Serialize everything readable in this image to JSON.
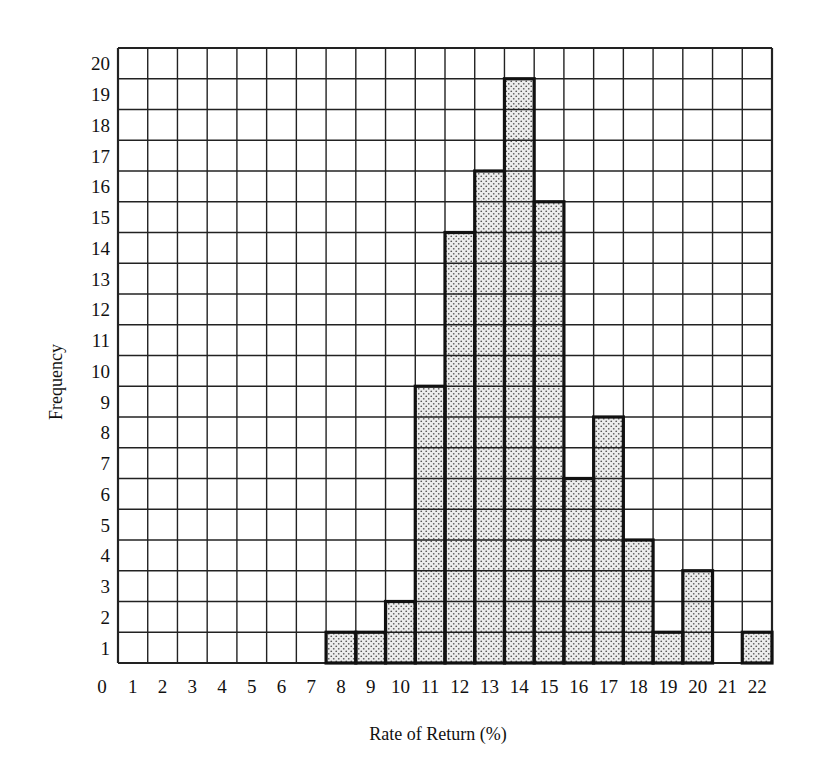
{
  "chart_data": {
    "type": "bar",
    "title": "",
    "xlabel": "Rate of Return (%)",
    "ylabel": "Frequency",
    "x_tick_labels": [
      "0",
      "1",
      "2",
      "3",
      "4",
      "5",
      "6",
      "7",
      "8",
      "9",
      "10",
      "11",
      "12",
      "13",
      "14",
      "15",
      "16",
      "17",
      "18",
      "19",
      "20",
      "21",
      "22"
    ],
    "y_tick_labels": [
      "1",
      "2",
      "3",
      "4",
      "5",
      "6",
      "7",
      "8",
      "9",
      "10",
      "11",
      "12",
      "13",
      "14",
      "15",
      "16",
      "17",
      "18",
      "19",
      "20"
    ],
    "categories": [
      1,
      2,
      3,
      4,
      5,
      6,
      7,
      8,
      9,
      10,
      11,
      12,
      13,
      14,
      15,
      16,
      17,
      18,
      19,
      20,
      21,
      22
    ],
    "values": [
      0,
      0,
      0,
      0,
      0,
      0,
      0,
      1,
      1,
      2,
      9,
      14,
      16,
      19,
      15,
      6,
      8,
      4,
      1,
      3,
      0,
      1
    ],
    "xlim": [
      0,
      22
    ],
    "ylim": [
      0,
      20
    ],
    "grid": true,
    "legend": null,
    "bar_fill": "stippled light gray",
    "colors": {
      "grid": "#222222",
      "bar_fill": "#e6e6e6",
      "bar_dot": "#555555",
      "bar_edge": "#111111"
    }
  }
}
